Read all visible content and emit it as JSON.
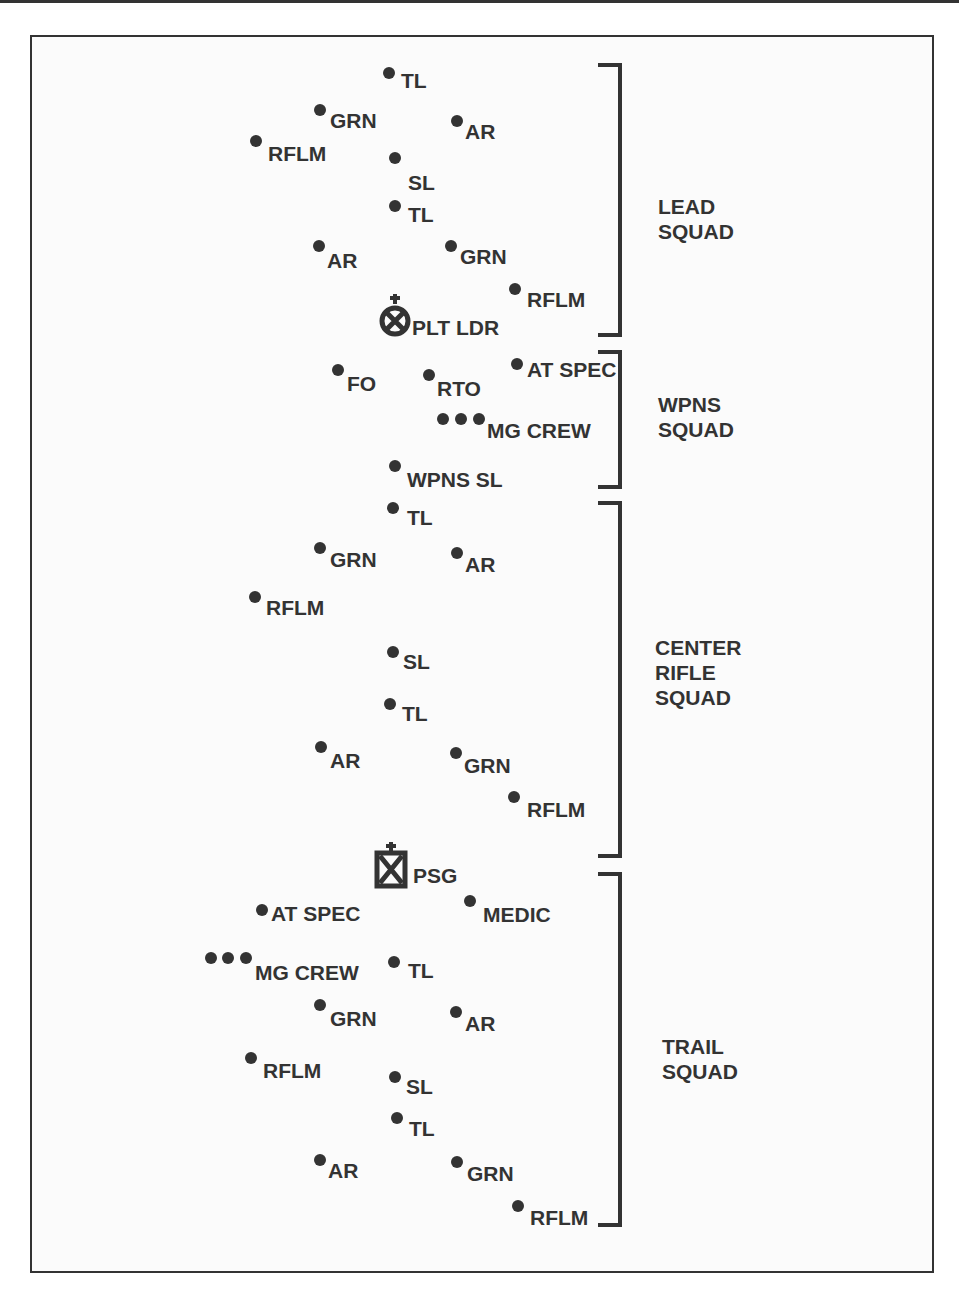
{
  "diagram": {
    "squads": [
      {
        "id": "lead",
        "label": "LEAD\nSQUAD",
        "bracket": {
          "x": 618,
          "y1": 63,
          "y2": 337
        },
        "label_pos": {
          "x": 658,
          "y": 194
        }
      },
      {
        "id": "wpns",
        "label": "WPNS\nSQUAD",
        "bracket": {
          "x": 618,
          "y1": 350,
          "y2": 489
        },
        "label_pos": {
          "x": 658,
          "y": 392
        }
      },
      {
        "id": "center",
        "label": "CENTER\nRIFLE\nSQUAD",
        "bracket": {
          "x": 618,
          "y1": 501,
          "y2": 858
        },
        "label_pos": {
          "x": 655,
          "y": 635
        }
      },
      {
        "id": "trail",
        "label": "TRAIL\nSQUAD",
        "bracket": {
          "x": 618,
          "y1": 872,
          "y2": 1227
        },
        "label_pos": {
          "x": 662,
          "y": 1034
        }
      }
    ],
    "members": [
      {
        "label": "TL",
        "dot": [
          389,
          73
        ],
        "text": [
          401,
          70
        ]
      },
      {
        "label": "GRN",
        "dot": [
          320,
          110
        ],
        "text": [
          330,
          110
        ]
      },
      {
        "label": "AR",
        "dot": [
          457,
          121
        ],
        "text": [
          465,
          121
        ]
      },
      {
        "label": "RFLM",
        "dot": [
          256,
          141
        ],
        "text": [
          268,
          143
        ]
      },
      {
        "label": "SL",
        "dot": [
          395,
          158
        ],
        "text": [
          408,
          172
        ]
      },
      {
        "label": "TL",
        "dot": [
          395,
          206
        ],
        "text": [
          408,
          204
        ]
      },
      {
        "label": "AR",
        "dot": [
          319,
          246
        ],
        "text": [
          327,
          250
        ]
      },
      {
        "label": "GRN",
        "dot": [
          451,
          246
        ],
        "text": [
          460,
          246
        ]
      },
      {
        "label": "RFLM",
        "dot": [
          515,
          289
        ],
        "text": [
          527,
          289
        ]
      },
      {
        "label": "FO",
        "dot": [
          338,
          370
        ],
        "text": [
          347,
          373
        ]
      },
      {
        "label": "RTO",
        "dot": [
          429,
          375
        ],
        "text": [
          437,
          378
        ]
      },
      {
        "label": "AT SPEC",
        "dot": [
          517,
          364
        ],
        "text": [
          527,
          359
        ]
      },
      {
        "label": "MG CREW",
        "dots": [
          [
            443,
            419
          ],
          [
            461,
            419
          ],
          [
            479,
            419
          ]
        ],
        "text": [
          487,
          420
        ]
      },
      {
        "label": "WPNS SL",
        "dot": [
          395,
          466
        ],
        "text": [
          407,
          469
        ]
      },
      {
        "label": "TL",
        "dot": [
          393,
          508
        ],
        "text": [
          407,
          507
        ]
      },
      {
        "label": "GRN",
        "dot": [
          320,
          548
        ],
        "text": [
          330,
          549
        ]
      },
      {
        "label": "AR",
        "dot": [
          457,
          553
        ],
        "text": [
          465,
          554
        ]
      },
      {
        "label": "RFLM",
        "dot": [
          255,
          597
        ],
        "text": [
          266,
          597
        ]
      },
      {
        "label": "SL",
        "dot": [
          393,
          652
        ],
        "text": [
          403,
          651
        ]
      },
      {
        "label": "TL",
        "dot": [
          390,
          704
        ],
        "text": [
          402,
          703
        ]
      },
      {
        "label": "AR",
        "dot": [
          321,
          747
        ],
        "text": [
          330,
          750
        ]
      },
      {
        "label": "GRN",
        "dot": [
          456,
          753
        ],
        "text": [
          464,
          755
        ]
      },
      {
        "label": "RFLM",
        "dot": [
          514,
          797
        ],
        "text": [
          527,
          799
        ]
      },
      {
        "label": "AT SPEC",
        "dot": [
          262,
          910
        ],
        "text": [
          271,
          903
        ]
      },
      {
        "label": "MEDIC",
        "dot": [
          470,
          901
        ],
        "text": [
          483,
          904
        ]
      },
      {
        "label": "MG CREW",
        "dots": [
          [
            211,
            958
          ],
          [
            228,
            958
          ],
          [
            246,
            958
          ]
        ],
        "text": [
          255,
          962
        ]
      },
      {
        "label": "TL",
        "dot": [
          394,
          962
        ],
        "text": [
          408,
          960
        ]
      },
      {
        "label": "GRN",
        "dot": [
          320,
          1005
        ],
        "text": [
          330,
          1008
        ]
      },
      {
        "label": "AR",
        "dot": [
          456,
          1012
        ],
        "text": [
          465,
          1013
        ]
      },
      {
        "label": "RFLM",
        "dot": [
          251,
          1058
        ],
        "text": [
          263,
          1060
        ]
      },
      {
        "label": "SL",
        "dot": [
          395,
          1077
        ],
        "text": [
          406,
          1076
        ]
      },
      {
        "label": "TL",
        "dot": [
          397,
          1118
        ],
        "text": [
          409,
          1118
        ]
      },
      {
        "label": "AR",
        "dot": [
          320,
          1160
        ],
        "text": [
          328,
          1160
        ]
      },
      {
        "label": "GRN",
        "dot": [
          457,
          1162
        ],
        "text": [
          467,
          1163
        ]
      },
      {
        "label": "RFLM",
        "dot": [
          518,
          1206
        ],
        "text": [
          530,
          1207
        ]
      }
    ],
    "leaders": [
      {
        "label": "PLT LDR",
        "symbol": "circle-x",
        "x": 378,
        "y": 292,
        "text": [
          412,
          317
        ]
      },
      {
        "label": "PSG",
        "symbol": "square-x",
        "x": 374,
        "y": 840,
        "text": [
          413,
          865
        ]
      }
    ]
  }
}
